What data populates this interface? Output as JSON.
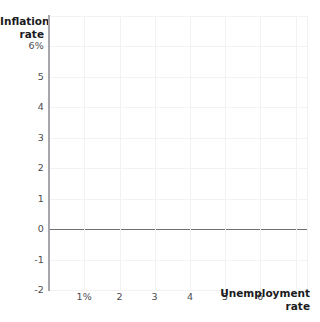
{
  "chart_data": {
    "type": "line",
    "title": "",
    "subtitle": "",
    "xlabel": "Unemployment rate",
    "ylabel": "Inflation rate",
    "xlabel_lines": [
      "Unemployment",
      "rate"
    ],
    "ylabel_lines": [
      "Inflation",
      "rate"
    ],
    "xlim": [
      0,
      7.35
    ],
    "ylim": [
      -2,
      7.0
    ],
    "xticks": [
      1,
      2,
      3,
      4,
      5,
      6
    ],
    "xtick_labels": [
      "1%",
      "2",
      "3",
      "4",
      "5",
      "6"
    ],
    "yticks": [
      6,
      5,
      4,
      3,
      2,
      1,
      0,
      -1,
      -2
    ],
    "ytick_labels": [
      "6%",
      "5",
      "4",
      "3",
      "2",
      "1",
      "0",
      "-1",
      "-2"
    ],
    "grid": true,
    "grid_color": "#f2f2f3",
    "axis_color": "#a7a7ab",
    "zero_line": {
      "value": 0,
      "color": "#6f6f73",
      "orientation": "horizontal"
    },
    "legend": null,
    "series": [],
    "annotations": [],
    "note": "Empty Phillips-curve style grid: axes, gridlines and a zero reference line only; no data series plotted."
  }
}
